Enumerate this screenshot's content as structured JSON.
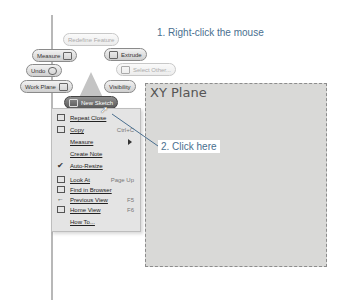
{
  "callouts": {
    "step1": "1. Right-click the mouse",
    "step2": "2. Click here"
  },
  "marking_menu": {
    "redefine_feature": "Redefine Feature",
    "measure": "Measure",
    "extrude": "Extrude",
    "undo": "Undo",
    "select_other": "Select Other...",
    "work_plane": "Work Plane",
    "visibility": "Visibility",
    "new_sketch": "New Sketch"
  },
  "context_menu": {
    "items": [
      {
        "label": "Repeat Close",
        "shortcut": "",
        "icon": "repeat-icon"
      },
      {
        "label": "Copy",
        "shortcut": "Ctrl+C",
        "icon": "copy-icon"
      },
      {
        "label": "Measure",
        "shortcut": "",
        "icon": "",
        "submenu": true
      },
      {
        "label": "Create Note",
        "shortcut": "",
        "icon": ""
      },
      {
        "label": "Auto-Resize",
        "shortcut": "",
        "icon": "checkmark-icon",
        "checked": true
      },
      {
        "label": "Look At",
        "shortcut": "Page Up",
        "icon": "look-at-icon"
      },
      {
        "label": "Find in Browser",
        "shortcut": "",
        "icon": "find-icon"
      },
      {
        "label": "Previous View",
        "shortcut": "F5",
        "icon": "previous-view-icon"
      },
      {
        "label": "Home View",
        "shortcut": "F6",
        "icon": "home-view-icon"
      },
      {
        "label": "How To...",
        "shortcut": "",
        "icon": ""
      }
    ]
  },
  "viewport": {
    "plane_label": "XY Plane"
  },
  "colors": {
    "callout_text": "#4a6f8f",
    "plane_fill": "#d9d9d7",
    "menu_bg": "#e4e4e4"
  }
}
